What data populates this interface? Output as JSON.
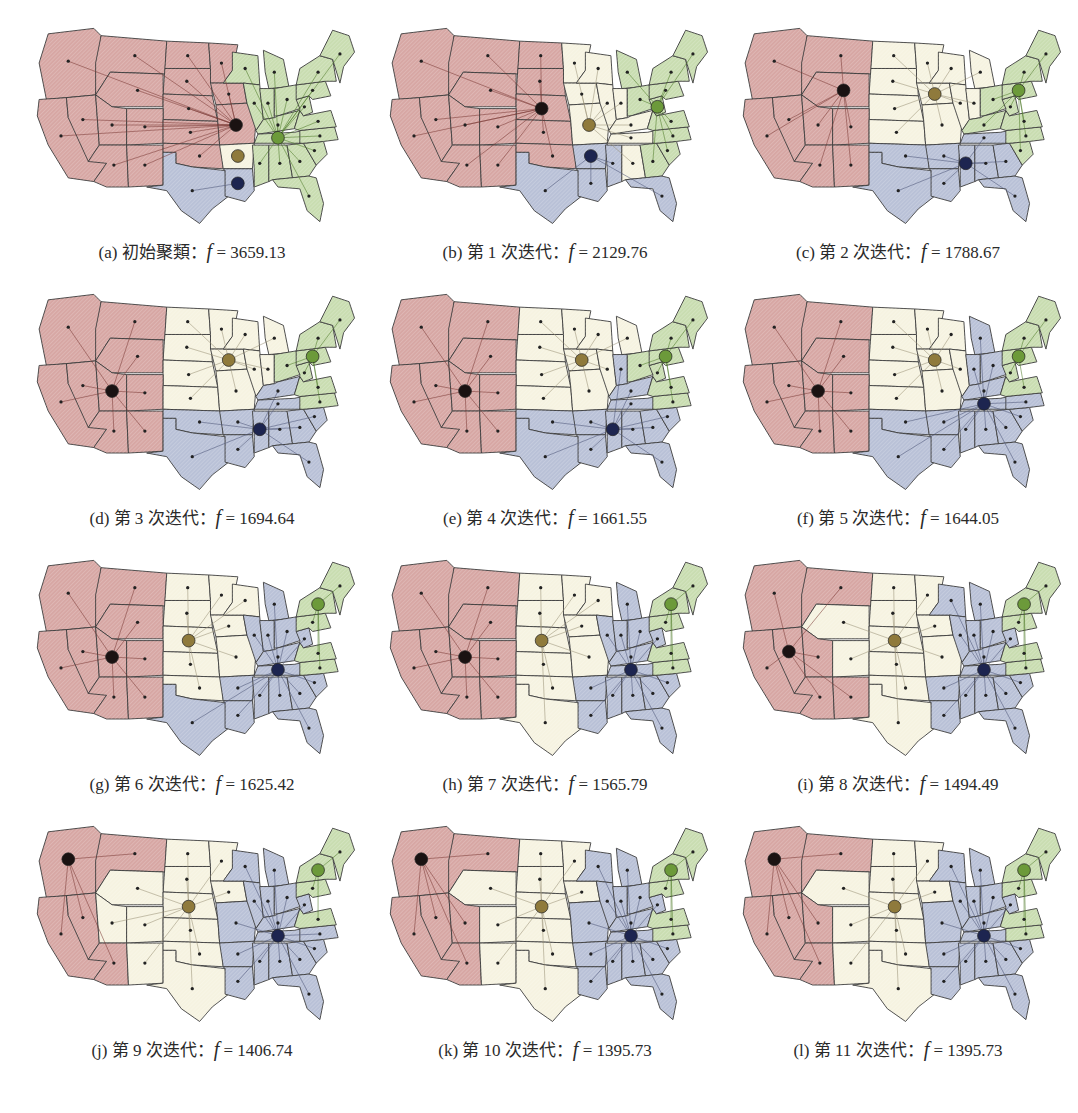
{
  "figure": {
    "colors": {
      "west": "#d7a7a4",
      "central": "#f6f3e1",
      "south": "#b9c1d7",
      "east": "#c9ddb1",
      "west_center": "#1a1212",
      "central_center": "#8f7a3c",
      "south_center": "#1d2550",
      "east_center": "#6c9a3a"
    },
    "panels": [
      {
        "label": "(a)",
        "title": "初始聚類",
        "f_symbol": "f",
        "equals": "=",
        "value": "3659.13",
        "assign": {
          "PNW": "west",
          "MT": "west",
          "ND": "west",
          "SD": "west",
          "WY": "west",
          "NE": "west",
          "CA": "west",
          "NV": "west",
          "UT": "west",
          "CO": "west",
          "KS": "west",
          "AZ": "west",
          "NM": "west",
          "OK": "west",
          "MN": "west",
          "IA": "west",
          "MO": "west",
          "TX": "south",
          "LA": "south",
          "AR": "central",
          "WI": "east",
          "MI": "east",
          "IL": "east",
          "IN": "east",
          "OH": "east",
          "KY": "east",
          "TN": "east",
          "MS": "east",
          "AL": "east",
          "GA": "east",
          "FL": "east",
          "SC": "east",
          "NC": "east",
          "VA": "east",
          "WV": "east",
          "PA": "east",
          "NY": "east",
          "NE_US": "east"
        },
        "centers": {
          "west": "MO",
          "central": "AR",
          "south": "LA",
          "east": "TN"
        }
      },
      {
        "label": "(b)",
        "title": "第 1 次迭代",
        "f_symbol": "f",
        "equals": "=",
        "value": "2129.76",
        "assign": {
          "PNW": "west",
          "MT": "west",
          "ND": "west",
          "SD": "west",
          "WY": "west",
          "NE": "west",
          "CA": "west",
          "NV": "west",
          "UT": "west",
          "CO": "west",
          "KS": "west",
          "AZ": "west",
          "NM": "west",
          "OK": "west",
          "MN": "central",
          "IA": "central",
          "MO": "central",
          "TX": "south",
          "LA": "south",
          "AR": "south",
          "WI": "central",
          "MI": "east",
          "IL": "central",
          "IN": "central",
          "OH": "east",
          "KY": "central",
          "TN": "central",
          "MS": "south",
          "AL": "central",
          "GA": "east",
          "FL": "south",
          "SC": "east",
          "NC": "east",
          "VA": "east",
          "WV": "east",
          "PA": "east",
          "NY": "east",
          "NE_US": "east"
        },
        "centers": {
          "west": "NE",
          "central": "MO",
          "south": "AR",
          "east": "WV"
        }
      },
      {
        "label": "(c)",
        "title": "第 2 次迭代",
        "f_symbol": "f",
        "equals": "=",
        "value": "1788.67",
        "assign": {
          "PNW": "west",
          "MT": "west",
          "ND": "central",
          "SD": "central",
          "WY": "west",
          "NE": "central",
          "CA": "west",
          "NV": "west",
          "UT": "west",
          "CO": "west",
          "KS": "central",
          "AZ": "west",
          "NM": "west",
          "OK": "south",
          "MN": "central",
          "IA": "central",
          "MO": "central",
          "TX": "south",
          "LA": "south",
          "AR": "south",
          "WI": "central",
          "MI": "central",
          "IL": "central",
          "IN": "central",
          "OH": "east",
          "KY": "east",
          "TN": "south",
          "MS": "south",
          "AL": "south",
          "GA": "south",
          "FL": "south",
          "SC": "east",
          "NC": "east",
          "VA": "east",
          "WV": "east",
          "PA": "east",
          "NY": "east",
          "NE_US": "east"
        },
        "centers": {
          "west": "WY",
          "central": "IA",
          "south": "MS",
          "east": "PA"
        }
      },
      {
        "label": "(d)",
        "title": "第 3 次迭代",
        "f_symbol": "f",
        "equals": "=",
        "value": "1694.64",
        "assign": {
          "PNW": "west",
          "MT": "west",
          "ND": "central",
          "SD": "central",
          "WY": "west",
          "NE": "central",
          "CA": "west",
          "NV": "west",
          "UT": "west",
          "CO": "west",
          "KS": "central",
          "AZ": "west",
          "NM": "west",
          "OK": "south",
          "MN": "central",
          "IA": "central",
          "MO": "central",
          "TX": "south",
          "LA": "south",
          "AR": "south",
          "WI": "central",
          "MI": "central",
          "IL": "central",
          "IN": "central",
          "OH": "east",
          "KY": "south",
          "TN": "south",
          "MS": "south",
          "AL": "south",
          "GA": "south",
          "FL": "south",
          "SC": "south",
          "NC": "east",
          "VA": "east",
          "WV": "east",
          "PA": "east",
          "NY": "east",
          "NE_US": "east"
        },
        "centers": {
          "west": "UT",
          "central": "IA",
          "south": "MS",
          "east": "PA"
        }
      },
      {
        "label": "(e)",
        "title": "第 4 次迭代",
        "f_symbol": "f",
        "equals": "=",
        "value": "1661.55",
        "assign": {
          "PNW": "west",
          "MT": "west",
          "ND": "central",
          "SD": "central",
          "WY": "west",
          "NE": "central",
          "CA": "west",
          "NV": "west",
          "UT": "west",
          "CO": "west",
          "KS": "central",
          "AZ": "west",
          "NM": "west",
          "OK": "south",
          "MN": "central",
          "IA": "central",
          "MO": "central",
          "TX": "south",
          "LA": "south",
          "AR": "south",
          "WI": "central",
          "MI": "central",
          "IL": "central",
          "IN": "south",
          "OH": "east",
          "KY": "south",
          "TN": "south",
          "MS": "south",
          "AL": "south",
          "GA": "south",
          "FL": "south",
          "SC": "south",
          "NC": "east",
          "VA": "east",
          "WV": "east",
          "PA": "east",
          "NY": "east",
          "NE_US": "east"
        },
        "centers": {
          "west": "UT",
          "central": "IA",
          "south": "MS",
          "east": "PA"
        }
      },
      {
        "label": "(f)",
        "title": "第 5 次迭代",
        "f_symbol": "f",
        "equals": "=",
        "value": "1644.05",
        "assign": {
          "PNW": "west",
          "MT": "west",
          "ND": "central",
          "SD": "central",
          "WY": "west",
          "NE": "central",
          "CA": "west",
          "NV": "west",
          "UT": "west",
          "CO": "west",
          "KS": "central",
          "AZ": "west",
          "NM": "west",
          "OK": "south",
          "MN": "central",
          "IA": "central",
          "MO": "central",
          "TX": "south",
          "LA": "south",
          "AR": "south",
          "WI": "central",
          "MI": "south",
          "IL": "central",
          "IN": "south",
          "OH": "south",
          "KY": "south",
          "TN": "south",
          "MS": "south",
          "AL": "south",
          "GA": "south",
          "FL": "south",
          "SC": "south",
          "NC": "south",
          "VA": "east",
          "WV": "east",
          "PA": "east",
          "NY": "east",
          "NE_US": "east"
        },
        "centers": {
          "west": "UT",
          "central": "IA",
          "south": "TN",
          "east": "PA"
        }
      },
      {
        "label": "(g)",
        "title": "第 6 次迭代",
        "f_symbol": "f",
        "equals": "=",
        "value": "1625.42",
        "assign": {
          "PNW": "west",
          "MT": "west",
          "ND": "central",
          "SD": "central",
          "WY": "west",
          "NE": "central",
          "CA": "west",
          "NV": "west",
          "UT": "west",
          "CO": "west",
          "KS": "central",
          "AZ": "west",
          "NM": "west",
          "OK": "central",
          "MN": "central",
          "IA": "central",
          "MO": "central",
          "TX": "south",
          "LA": "south",
          "AR": "south",
          "WI": "central",
          "MI": "south",
          "IL": "south",
          "IN": "south",
          "OH": "south",
          "KY": "south",
          "TN": "south",
          "MS": "south",
          "AL": "south",
          "GA": "south",
          "FL": "south",
          "SC": "south",
          "NC": "east",
          "VA": "east",
          "WV": "south",
          "PA": "east",
          "NY": "east",
          "NE_US": "east"
        },
        "centers": {
          "west": "UT",
          "central": "NE",
          "south": "TN",
          "east": "NY"
        }
      },
      {
        "label": "(h)",
        "title": "第 7 次迭代",
        "f_symbol": "f",
        "equals": "=",
        "value": "1565.79",
        "assign": {
          "PNW": "west",
          "MT": "west",
          "ND": "central",
          "SD": "central",
          "WY": "west",
          "NE": "central",
          "CA": "west",
          "NV": "west",
          "UT": "west",
          "CO": "west",
          "KS": "central",
          "AZ": "west",
          "NM": "west",
          "OK": "central",
          "MN": "central",
          "IA": "central",
          "MO": "central",
          "TX": "central",
          "LA": "south",
          "AR": "south",
          "WI": "central",
          "MI": "south",
          "IL": "south",
          "IN": "south",
          "OH": "south",
          "KY": "south",
          "TN": "south",
          "MS": "south",
          "AL": "south",
          "GA": "south",
          "FL": "south",
          "SC": "south",
          "NC": "east",
          "VA": "east",
          "WV": "south",
          "PA": "east",
          "NY": "east",
          "NE_US": "east"
        },
        "centers": {
          "west": "UT",
          "central": "NE",
          "south": "TN",
          "east": "NY"
        }
      },
      {
        "label": "(i)",
        "title": "第 8 次迭代",
        "f_symbol": "f",
        "equals": "=",
        "value": "1494.49",
        "assign": {
          "PNW": "west",
          "MT": "west",
          "ND": "central",
          "SD": "central",
          "WY": "central",
          "NE": "central",
          "CA": "west",
          "NV": "west",
          "UT": "west",
          "CO": "central",
          "KS": "central",
          "AZ": "west",
          "NM": "west",
          "OK": "central",
          "MN": "central",
          "IA": "central",
          "MO": "central",
          "TX": "central",
          "LA": "south",
          "AR": "south",
          "WI": "south",
          "MI": "south",
          "IL": "south",
          "IN": "south",
          "OH": "south",
          "KY": "south",
          "TN": "south",
          "MS": "south",
          "AL": "south",
          "GA": "south",
          "FL": "south",
          "SC": "south",
          "NC": "east",
          "VA": "east",
          "WV": "south",
          "PA": "east",
          "NY": "east",
          "NE_US": "east"
        },
        "centers": {
          "west": "NV",
          "central": "NE",
          "south": "TN",
          "east": "NY"
        }
      },
      {
        "label": "(j)",
        "title": "第 9 次迭代",
        "f_symbol": "f",
        "equals": "=",
        "value": "1406.74",
        "assign": {
          "PNW": "west",
          "MT": "west",
          "ND": "central",
          "SD": "central",
          "WY": "central",
          "NE": "central",
          "CA": "west",
          "NV": "west",
          "UT": "central",
          "CO": "central",
          "KS": "central",
          "AZ": "west",
          "NM": "central",
          "OK": "central",
          "MN": "central",
          "IA": "central",
          "MO": "south",
          "TX": "central",
          "LA": "south",
          "AR": "south",
          "WI": "south",
          "MI": "south",
          "IL": "south",
          "IN": "south",
          "OH": "south",
          "KY": "south",
          "TN": "south",
          "MS": "south",
          "AL": "south",
          "GA": "south",
          "FL": "south",
          "SC": "south",
          "NC": "south",
          "VA": "east",
          "WV": "south",
          "PA": "east",
          "NY": "east",
          "NE_US": "east"
        },
        "centers": {
          "west": "PNW",
          "central": "NE",
          "south": "TN",
          "east": "NY"
        }
      },
      {
        "label": "(k)",
        "title": "第 10 次迭代",
        "f_symbol": "f",
        "equals": "=",
        "value": "1395.73",
        "assign": {
          "PNW": "west",
          "MT": "west",
          "ND": "central",
          "SD": "central",
          "WY": "central",
          "NE": "central",
          "CA": "west",
          "NV": "west",
          "UT": "west",
          "CO": "central",
          "KS": "central",
          "AZ": "west",
          "NM": "central",
          "OK": "central",
          "MN": "central",
          "IA": "central",
          "MO": "south",
          "TX": "central",
          "LA": "south",
          "AR": "south",
          "WI": "south",
          "MI": "south",
          "IL": "south",
          "IN": "south",
          "OH": "south",
          "KY": "south",
          "TN": "south",
          "MS": "south",
          "AL": "south",
          "GA": "south",
          "FL": "south",
          "SC": "south",
          "NC": "east",
          "VA": "east",
          "WV": "south",
          "PA": "east",
          "NY": "east",
          "NE_US": "east"
        },
        "centers": {
          "west": "PNW",
          "central": "NE",
          "south": "TN",
          "east": "NY"
        }
      },
      {
        "label": "(l)",
        "title": "第 11 次迭代",
        "f_symbol": "f",
        "equals": "=",
        "value": "1395.73",
        "assign": {
          "PNW": "west",
          "MT": "west",
          "ND": "central",
          "SD": "central",
          "WY": "central",
          "NE": "central",
          "CA": "west",
          "NV": "west",
          "UT": "west",
          "CO": "central",
          "KS": "central",
          "AZ": "west",
          "NM": "central",
          "OK": "central",
          "MN": "central",
          "IA": "central",
          "MO": "south",
          "TX": "central",
          "LA": "south",
          "AR": "south",
          "WI": "south",
          "MI": "south",
          "IL": "south",
          "IN": "south",
          "OH": "south",
          "KY": "south",
          "TN": "south",
          "MS": "south",
          "AL": "south",
          "GA": "south",
          "FL": "south",
          "SC": "south",
          "NC": "east",
          "VA": "east",
          "WV": "south",
          "PA": "east",
          "NY": "east",
          "NE_US": "east"
        },
        "centers": {
          "west": "PNW",
          "central": "NE",
          "south": "TN",
          "east": "NY"
        }
      }
    ]
  }
}
